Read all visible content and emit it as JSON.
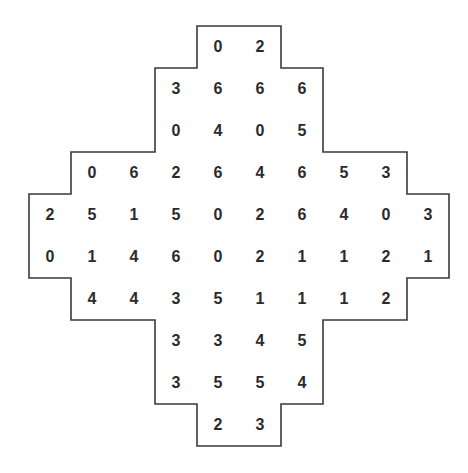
{
  "puzzle": {
    "outline_color": "#3a3a3a",
    "text_color": "#2b2b2b",
    "grid_origin": {
      "x": 29,
      "y": 26
    },
    "cell_size": 42,
    "rows": [
      {
        "start_col": 4,
        "values": [
          "0",
          "2"
        ]
      },
      {
        "start_col": 3,
        "values": [
          "3",
          "6",
          "6",
          "6"
        ]
      },
      {
        "start_col": 3,
        "values": [
          "0",
          "4",
          "0",
          "5"
        ]
      },
      {
        "start_col": 1,
        "values": [
          "0",
          "6",
          "2",
          "6",
          "4",
          "6",
          "5",
          "3"
        ]
      },
      {
        "start_col": 0,
        "values": [
          "2",
          "5",
          "1",
          "5",
          "0",
          "2",
          "6",
          "4",
          "0",
          "3"
        ]
      },
      {
        "start_col": 0,
        "values": [
          "0",
          "1",
          "4",
          "6",
          "0",
          "2",
          "1",
          "1",
          "2",
          "1"
        ]
      },
      {
        "start_col": 1,
        "values": [
          "4",
          "4",
          "3",
          "5",
          "1",
          "1",
          "1",
          "2"
        ]
      },
      {
        "start_col": 3,
        "values": [
          "3",
          "3",
          "4",
          "5"
        ]
      },
      {
        "start_col": 3,
        "values": [
          "3",
          "5",
          "5",
          "4"
        ]
      },
      {
        "start_col": 4,
        "values": [
          "2",
          "3"
        ]
      }
    ]
  }
}
